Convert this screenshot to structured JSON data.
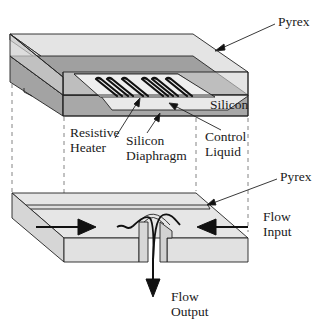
{
  "diagram": {
    "type": "exploded view of thermopneumatic microvalve",
    "top_assembly": {
      "layers": [
        "Pyrex",
        "Silicon"
      ],
      "features": [
        "Resistive Heater",
        "Silicon Diaphragm",
        "Control Liquid"
      ]
    },
    "bottom_assembly": {
      "layers": [
        "Pyrex"
      ],
      "flows": [
        "Flow Input",
        "Flow Output"
      ]
    }
  },
  "labels": {
    "pyrex_top": "Pyrex",
    "silicon": "Silicon",
    "resistive_heater_line1": "Resistive",
    "resistive_heater_line2": "Heater",
    "silicon_diaphragm_line1": "Silicon",
    "silicon_diaphragm_line2": "Diaphragm",
    "control_liquid_line1": "Control",
    "control_liquid_line2": "Liquid",
    "pyrex_bottom": "Pyrex",
    "flow_input_line1": "Flow",
    "flow_input_line2": "Input",
    "flow_output_line1": "Flow",
    "flow_output_line2": "Output"
  },
  "colors": {
    "pyrex": "#e6e6e6",
    "pyrex_side": "#d9d9d9",
    "silicon": "#a8a8a8",
    "silicon_dark": "#9a9a9a",
    "cavity": "#e8e8e8",
    "outline": "#222222",
    "dashed": "#555555"
  }
}
